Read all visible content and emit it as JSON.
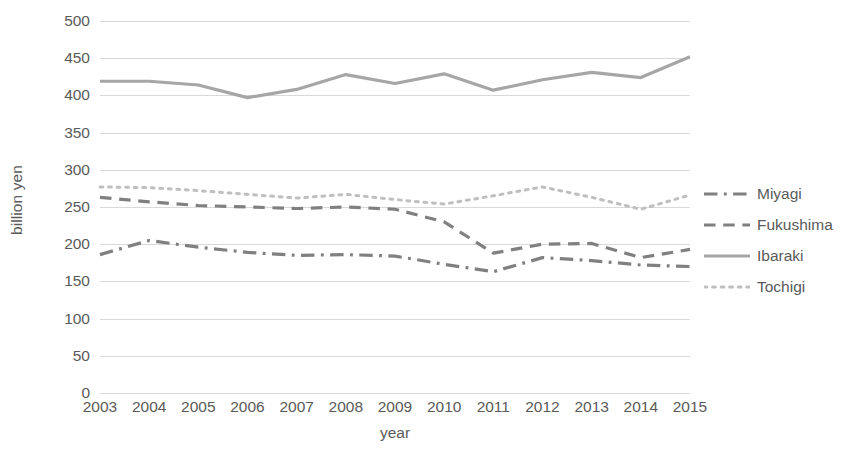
{
  "chart_data": {
    "type": "line",
    "title": "",
    "xlabel": "year",
    "ylabel": "billion yen",
    "x": [
      2003,
      2004,
      2005,
      2006,
      2007,
      2008,
      2009,
      2010,
      2011,
      2012,
      2013,
      2014,
      2015
    ],
    "xtick_labels": [
      "2003",
      "2004",
      "2005",
      "2006",
      "2007",
      "2008",
      "2009",
      "2010",
      "2011",
      "2012",
      "2013",
      "2014",
      "2015"
    ],
    "ytick_labels": [
      "0",
      "50",
      "100",
      "150",
      "200",
      "250",
      "300",
      "350",
      "400",
      "450",
      "500"
    ],
    "yticks": [
      0,
      50,
      100,
      150,
      200,
      250,
      300,
      350,
      400,
      450,
      500
    ],
    "ylim": [
      0,
      500
    ],
    "xlim": [
      2003,
      2015
    ],
    "grid": true,
    "grid_color": "#d9d9d9",
    "legend_position": "right",
    "series": [
      {
        "name": "Miyagi",
        "dash": "dashdot",
        "color": "#808080",
        "values": [
          186,
          205,
          196,
          189,
          185,
          186,
          184,
          173,
          163,
          182,
          178,
          172,
          170
        ]
      },
      {
        "name": "Fukushima",
        "dash": "dashed",
        "color": "#808080",
        "values": [
          263,
          257,
          252,
          250,
          248,
          250,
          247,
          230,
          188,
          200,
          201,
          182,
          193
        ]
      },
      {
        "name": "Ibaraki",
        "dash": "solid",
        "color": "#a6a6a6",
        "values": [
          419,
          419,
          414,
          397,
          408,
          428,
          416,
          429,
          407,
          421,
          431,
          424,
          452
        ]
      },
      {
        "name": "Tochigi",
        "dash": "dotted",
        "color": "#bfbfbf",
        "values": [
          277,
          276,
          272,
          267,
          262,
          267,
          260,
          254,
          265,
          277,
          263,
          247,
          266
        ]
      }
    ]
  },
  "legend": {
    "items": [
      {
        "label": "Miyagi",
        "dash": "dashdot",
        "color": "#808080"
      },
      {
        "label": "Fukushima",
        "dash": "dashed",
        "color": "#808080"
      },
      {
        "label": "Ibaraki",
        "dash": "solid",
        "color": "#a6a6a6"
      },
      {
        "label": "Tochigi",
        "dash": "dotted",
        "color": "#bfbfbf"
      }
    ]
  }
}
